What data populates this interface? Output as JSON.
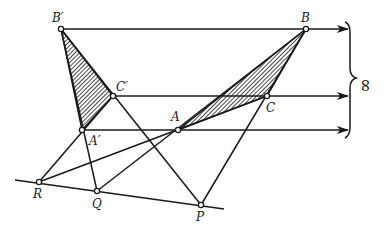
{
  "diagram": {
    "points": {
      "B_prime": {
        "label": "B′",
        "x": 61,
        "y": 29
      },
      "B": {
        "label": "B",
        "x": 306,
        "y": 29
      },
      "C_prime": {
        "label": "C′",
        "x": 113,
        "y": 96
      },
      "C": {
        "label": "C",
        "x": 267,
        "y": 96
      },
      "A_prime": {
        "label": "A′",
        "x": 82,
        "y": 130
      },
      "A": {
        "label": "A",
        "x": 178,
        "y": 130
      },
      "R": {
        "label": "R",
        "x": 39,
        "y": 182
      },
      "Q": {
        "label": "Q",
        "x": 97,
        "y": 191
      },
      "P": {
        "label": "P",
        "x": 201,
        "y": 205
      }
    },
    "infinity_label": "∞",
    "shaded_triangles": [
      "A′B′C′",
      "ABC"
    ],
    "colors": {
      "ink": "#1a1a1a",
      "background": "#ffffff"
    }
  }
}
